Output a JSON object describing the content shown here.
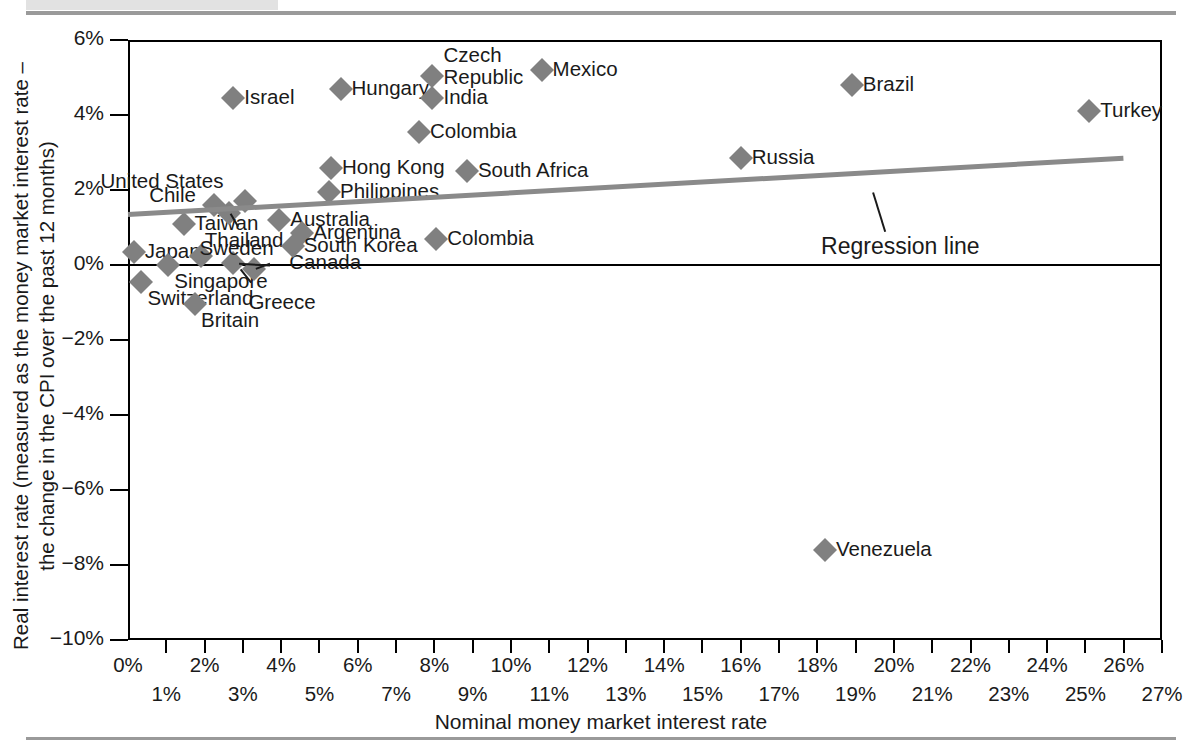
{
  "figure": {
    "x_axis_title": "Nominal money market interest rate",
    "y_axis_title_line1": "Real interest rate (measured as the money market interest rate –",
    "y_axis_title_line2": "the change in the CPI over the past 12 months)",
    "annotation": "Regression line"
  },
  "chart_data": {
    "type": "scatter",
    "title": "",
    "xlabel": "Nominal money market interest rate",
    "ylabel": "Real interest rate (measured as the money market interest rate – the change in the CPI over the past 12 months)",
    "xlim": [
      0,
      27
    ],
    "ylim": [
      -10,
      6
    ],
    "grid": false,
    "legend": null,
    "x_unit": "%",
    "y_unit": "%",
    "x_ticks": [
      "0%",
      "1%",
      "2%",
      "3%",
      "4%",
      "5%",
      "6%",
      "7%",
      "8%",
      "9%",
      "10%",
      "11%",
      "12%",
      "13%",
      "14%",
      "15%",
      "16%",
      "17%",
      "18%",
      "19%",
      "20%",
      "21%",
      "22%",
      "23%",
      "24%",
      "25%",
      "26%",
      "27%"
    ],
    "y_ticks": [
      "6%",
      "4%",
      "2%",
      "0%",
      "-2%",
      "-4%",
      "-6%",
      "-8%",
      "-10%"
    ],
    "annotations": [
      {
        "text": "Regression line",
        "x": 20.5,
        "y": 0.95
      }
    ],
    "trendline": {
      "name": "Regression line",
      "x0": 0.0,
      "y0": 1.35,
      "x1": 26.0,
      "y1": 2.85
    },
    "points": [
      {
        "label": "Japan",
        "x": 0.15,
        "y": 0.35,
        "label_pos": "right"
      },
      {
        "label": "Switzerland",
        "x": 0.35,
        "y": -0.45,
        "label_pos": "below-right"
      },
      {
        "label": "Singapore",
        "x": 1.05,
        "y": 0.0,
        "label_pos": "below-right"
      },
      {
        "label": "Taiwan",
        "x": 1.45,
        "y": 1.1,
        "label_pos": "right"
      },
      {
        "label": "Britain",
        "x": 1.75,
        "y": -1.05,
        "label_pos": "below-right"
      },
      {
        "label": "Thailand",
        "x": 1.9,
        "y": 0.25,
        "label_pos": "above-right"
      },
      {
        "label": "Chile",
        "x": 2.25,
        "y": 1.6,
        "label_pos": "left"
      },
      {
        "label": "Canada",
        "x": 2.75,
        "y": 0.05,
        "label_pos": "callout"
      },
      {
        "label": "Israel",
        "x": 2.75,
        "y": 4.45,
        "label_pos": "right"
      },
      {
        "label": "Greece",
        "x": 3.3,
        "y": -0.1,
        "label_pos": "callout"
      },
      {
        "label": "United States",
        "x": 3.05,
        "y": 1.7,
        "label_pos": "above-left"
      },
      {
        "label": "Sweden",
        "x": 2.65,
        "y": 1.4,
        "label_pos": "callout"
      },
      {
        "label": "Australia",
        "x": 3.95,
        "y": 1.2,
        "label_pos": "right"
      },
      {
        "label": "Argentina",
        "x": 4.55,
        "y": 0.85,
        "label_pos": "right"
      },
      {
        "label": "South Korea",
        "x": 4.3,
        "y": 0.5,
        "label_pos": "right"
      },
      {
        "label": "Philippines",
        "x": 5.25,
        "y": 1.95,
        "label_pos": "right"
      },
      {
        "label": "Hong Kong",
        "x": 5.3,
        "y": 2.6,
        "label_pos": "right"
      },
      {
        "label": "Hungary",
        "x": 5.55,
        "y": 4.7,
        "label_pos": "right"
      },
      {
        "label": "Colombia",
        "x": 7.6,
        "y": 3.55,
        "label_pos": "right"
      },
      {
        "label": "Czech Republic",
        "x": 7.95,
        "y": 5.05,
        "label_pos": "right-two-line"
      },
      {
        "label": "India",
        "x": 7.95,
        "y": 4.45,
        "label_pos": "right"
      },
      {
        "label": "Colombia",
        "x": 8.05,
        "y": 0.7,
        "label_pos": "right"
      },
      {
        "label": "South Africa",
        "x": 8.85,
        "y": 2.5,
        "label_pos": "right"
      },
      {
        "label": "Mexico",
        "x": 10.8,
        "y": 5.2,
        "label_pos": "right"
      },
      {
        "label": "Russia",
        "x": 16.0,
        "y": 2.85,
        "label_pos": "right"
      },
      {
        "label": "Venezuela",
        "x": 18.2,
        "y": -7.6,
        "label_pos": "right"
      },
      {
        "label": "Brazil",
        "x": 18.9,
        "y": 4.8,
        "label_pos": "right"
      },
      {
        "label": "Turkey",
        "x": 25.1,
        "y": 4.1,
        "label_pos": "right"
      }
    ]
  }
}
